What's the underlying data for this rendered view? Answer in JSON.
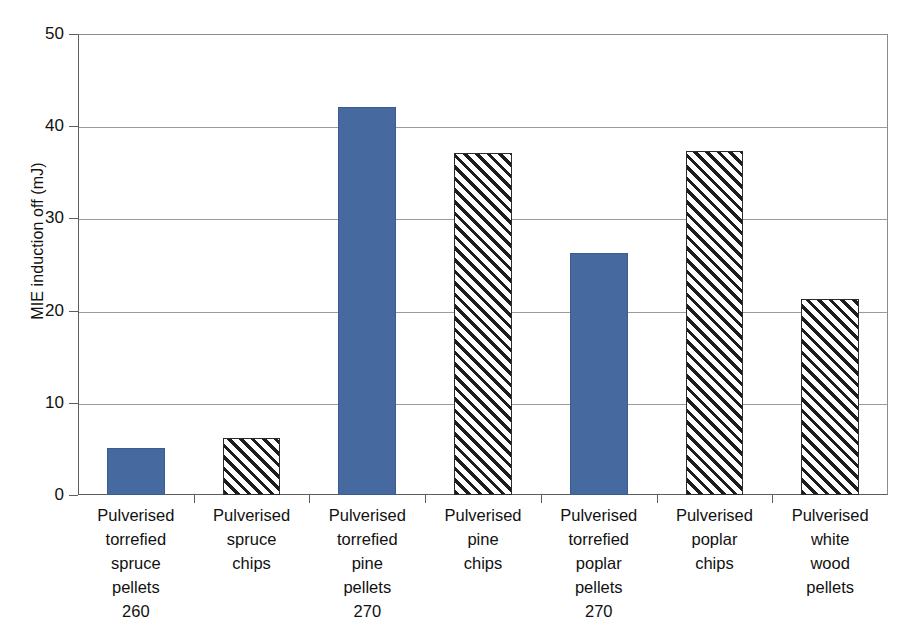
{
  "chart_data": {
    "type": "bar",
    "title": "",
    "xlabel": "",
    "ylabel": "MIE induction off (mJ)",
    "ylim": [
      0,
      50
    ],
    "ytick_values": [
      50,
      40,
      30,
      20,
      10,
      0
    ],
    "ytick_labels": [
      "50",
      "40",
      "30",
      "20",
      "10",
      "0"
    ],
    "grid": "horizontal",
    "legend": "none",
    "categories": [
      "Pulverised torrefied spruce pellets 260",
      "Pulverised spruce chips",
      "Pulverised torrefied pine pellets 270",
      "Pulverised pine chips",
      "Pulverised torrefied poplar pellets 270",
      "Pulverised poplar chips",
      "Pulverised white wood pellets"
    ],
    "category_label_lines": [
      [
        "Pulverised",
        "torrefied",
        "spruce",
        "pellets",
        "260"
      ],
      [
        "Pulverised",
        "spruce",
        "chips"
      ],
      [
        "Pulverised",
        "torrefied",
        "pine",
        "pellets",
        "270"
      ],
      [
        "Pulverised",
        "pine",
        "chips"
      ],
      [
        "Pulverised",
        "torrefied",
        "poplar",
        "pellets",
        "270"
      ],
      [
        "Pulverised",
        "poplar",
        "chips"
      ],
      [
        "Pulverised",
        "white",
        "wood",
        "pellets"
      ]
    ],
    "values": [
      5.1,
      6.2,
      42.1,
      37.1,
      26.2,
      37.3,
      21.3
    ],
    "bar_styles": [
      "solid",
      "hatched",
      "solid",
      "hatched",
      "solid",
      "hatched",
      "hatched"
    ],
    "series": [
      {
        "name": "MIE induction off",
        "values": [
          5.1,
          6.2,
          42.1,
          37.1,
          26.2,
          37.3,
          21.3
        ]
      }
    ],
    "colors": {
      "solid_fill": "#466a9f",
      "solid_border": "#3b5c8c",
      "hatch_line": "#1d1d1d",
      "hatch_background": "#ffffff",
      "gridline": "#9b9b9b",
      "axis": "#5d5d5d",
      "background": "#ffffff",
      "text": "#111111"
    }
  }
}
